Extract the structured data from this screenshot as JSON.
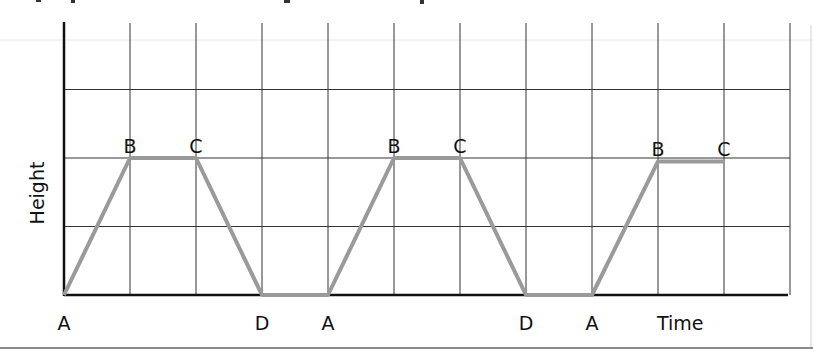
{
  "chart_data": {
    "type": "line",
    "title": "",
    "xlabel": "Time",
    "ylabel": "Height",
    "grid": true,
    "legend": null,
    "x_gridlines": 11,
    "y_gridlines": 4,
    "points": [
      {
        "label": "A",
        "x": 0,
        "y": 0
      },
      {
        "label": "B",
        "x": 1,
        "y": 2
      },
      {
        "label": "C",
        "x": 2,
        "y": 2
      },
      {
        "label": "D",
        "x": 3,
        "y": 0
      },
      {
        "label": "A",
        "x": 4,
        "y": 0
      },
      {
        "label": "B",
        "x": 5,
        "y": 2
      },
      {
        "label": "C",
        "x": 6,
        "y": 2
      },
      {
        "label": "D",
        "x": 7,
        "y": 0
      },
      {
        "label": "A",
        "x": 8,
        "y": 0
      },
      {
        "label": "B",
        "x": 9,
        "y": 1.95
      },
      {
        "label": "C",
        "x": 10,
        "y": 1.95
      }
    ],
    "xlim": [
      0,
      11
    ],
    "ylim": [
      0,
      4
    ],
    "line_color": "#9a9a9a",
    "grid_color": "#333333",
    "axis_color": "#111111"
  },
  "labels": {
    "x_axis": "Time",
    "y_axis": "Height"
  }
}
